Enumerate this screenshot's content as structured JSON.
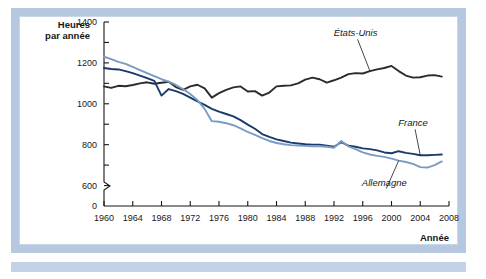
{
  "figure": {
    "frame_color": "#b6c8e0",
    "background": "#ffffff"
  },
  "chart_data": {
    "type": "line",
    "title": "",
    "xlabel": "Année",
    "ylabel": "Heures par année",
    "xlim": [
      1960,
      2008
    ],
    "ylim": [
      500,
      1400
    ],
    "grid": false,
    "legend_position": "inline-annotations",
    "y_ticks": [
      600,
      800,
      1000,
      1200,
      1400
    ],
    "y_zero_label": "0",
    "y_axis_break": true,
    "x_ticks": [
      1960,
      1964,
      1968,
      1972,
      1976,
      1980,
      1984,
      1988,
      1992,
      1996,
      2000,
      2004,
      2008
    ],
    "x": [
      1960,
      1961,
      1962,
      1963,
      1964,
      1965,
      1966,
      1967,
      1968,
      1969,
      1970,
      1971,
      1972,
      1973,
      1974,
      1975,
      1976,
      1977,
      1978,
      1979,
      1980,
      1981,
      1982,
      1983,
      1984,
      1985,
      1986,
      1987,
      1988,
      1989,
      1990,
      1991,
      1992,
      1993,
      1994,
      1995,
      1996,
      1997,
      1998,
      1999,
      2000,
      2001,
      2002,
      2003,
      2004,
      2005,
      2006,
      2007
    ],
    "series": [
      {
        "name": "États-Unis",
        "color": "#2b2b2b",
        "label_style": "italic",
        "values": [
          1085,
          1078,
          1088,
          1086,
          1092,
          1100,
          1105,
          1098,
          1103,
          1108,
          1082,
          1068,
          1085,
          1093,
          1075,
          1030,
          1052,
          1068,
          1080,
          1085,
          1060,
          1062,
          1040,
          1055,
          1085,
          1088,
          1090,
          1100,
          1118,
          1128,
          1120,
          1103,
          1115,
          1128,
          1145,
          1150,
          1148,
          1160,
          1168,
          1175,
          1185,
          1160,
          1138,
          1128,
          1130,
          1138,
          1140,
          1133
        ]
      },
      {
        "name": "France",
        "color": "#1b3a6b",
        "label_style": "italic",
        "values": [
          1175,
          1170,
          1168,
          1160,
          1150,
          1138,
          1125,
          1112,
          1040,
          1072,
          1062,
          1048,
          1030,
          1012,
          995,
          975,
          962,
          950,
          938,
          920,
          898,
          878,
          852,
          838,
          826,
          818,
          810,
          806,
          802,
          800,
          800,
          795,
          790,
          812,
          795,
          790,
          782,
          778,
          772,
          762,
          758,
          768,
          760,
          755,
          748,
          748,
          750,
          752
        ]
      },
      {
        "name": "Allemagne",
        "color": "#7a9bc4",
        "label_style": "italic",
        "values": [
          1230,
          1218,
          1205,
          1195,
          1180,
          1165,
          1150,
          1135,
          1120,
          1108,
          1092,
          1072,
          1048,
          1018,
          975,
          915,
          912,
          905,
          895,
          880,
          862,
          848,
          832,
          818,
          808,
          802,
          798,
          796,
          794,
          792,
          792,
          790,
          785,
          818,
          792,
          778,
          762,
          752,
          745,
          740,
          732,
          722,
          715,
          706,
          690,
          688,
          700,
          718
        ]
      }
    ],
    "annotations": [
      {
        "text": "États-Unis",
        "target_year": 1997,
        "label_x": 1995,
        "label_y": 1330
      },
      {
        "text": "France",
        "target_year": 2004,
        "label_x": 2003,
        "label_y": 890
      },
      {
        "text": "Allemagne",
        "target_year": 2001,
        "label_x": 1999,
        "label_y": 600
      }
    ]
  }
}
